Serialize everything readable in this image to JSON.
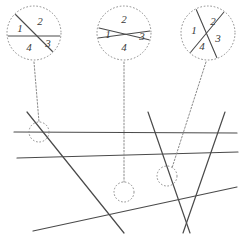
{
  "figure": {
    "width": 248,
    "height": 247,
    "background_color": "#ffffff",
    "line_color": "#4a4a4a",
    "callout_color": "#8a8a8a",
    "label_color": "#3a3a3a"
  },
  "arrangement": {
    "description": "Six straight lines crossing in the lower portion of the figure",
    "lines": [
      {
        "name": "horizontal-line",
        "x1": 14,
        "y1": 132,
        "x2": 237,
        "y2": 133
      },
      {
        "name": "steep-descending-line",
        "x1": 27,
        "y1": 112,
        "x2": 124,
        "y2": 233
      },
      {
        "name": "shallow-ascending-line",
        "x1": 17,
        "y1": 158,
        "x2": 238,
        "y2": 152
      },
      {
        "name": "shallow-descending-line",
        "x1": 33,
        "y1": 231,
        "x2": 237,
        "y2": 187
      },
      {
        "name": "v-left-line",
        "x1": 148,
        "y1": 112,
        "x2": 190,
        "y2": 233
      },
      {
        "name": "v-right-line",
        "x1": 225,
        "y1": 112,
        "x2": 183,
        "y2": 233
      }
    ]
  },
  "intersections": [
    {
      "name": "intersection-left",
      "cx": 39,
      "cy": 132,
      "r": 10
    },
    {
      "name": "intersection-middle",
      "cx": 124,
      "cy": 192,
      "r": 10
    },
    {
      "name": "intersection-right",
      "cx": 167,
      "cy": 176,
      "r": 10
    }
  ],
  "leaders": [
    {
      "name": "leader-left",
      "x1": 34,
      "y1": 62,
      "x2": 39,
      "y2": 122
    },
    {
      "name": "leader-middle",
      "x1": 124,
      "y1": 62,
      "x2": 124,
      "y2": 182
    },
    {
      "name": "leader-right",
      "x1": 206,
      "y1": 62,
      "x2": 172,
      "y2": 168
    }
  ],
  "callouts": [
    {
      "name": "callout-left",
      "cx": 34,
      "cy": 33,
      "r": 27,
      "crossing_type": "diagonal-and-horizontal",
      "chords": [
        {
          "name": "chord-diagonal",
          "x1": -19,
          "y1": -19,
          "x2": 19,
          "y2": 19
        },
        {
          "name": "chord-horizontal",
          "x1": -27,
          "y1": 3,
          "x2": 27,
          "y2": 3
        }
      ],
      "labels": [
        {
          "text": "1",
          "x": -14,
          "y": -4
        },
        {
          "text": "2",
          "x": 6,
          "y": -11
        },
        {
          "text": "3",
          "x": 14,
          "y": 11
        },
        {
          "text": "4",
          "x": -5,
          "y": 15
        }
      ]
    },
    {
      "name": "callout-middle",
      "cx": 124,
      "cy": 33,
      "r": 27,
      "crossing_type": "shallow-x",
      "chords": [
        {
          "name": "chord-rising",
          "x1": -26,
          "y1": 5,
          "x2": 26,
          "y2": -2
        },
        {
          "name": "chord-falling",
          "x1": -25,
          "y1": -5,
          "x2": 26,
          "y2": 7
        }
      ],
      "labels": [
        {
          "text": "2",
          "x": 0,
          "y": -13
        },
        {
          "text": "1",
          "x": -16,
          "y": 2
        },
        {
          "text": "3",
          "x": 18,
          "y": 4
        },
        {
          "text": "4",
          "x": 0,
          "y": 15
        }
      ]
    },
    {
      "name": "callout-right",
      "cx": 208,
      "cy": 33,
      "r": 27,
      "crossing_type": "near-perpendicular-steep",
      "chords": [
        {
          "name": "chord-steep-left",
          "x1": -12,
          "y1": -24,
          "x2": 9,
          "y2": 25
        },
        {
          "name": "chord-steep-right",
          "x1": 16,
          "y1": -21,
          "x2": -18,
          "y2": 20
        }
      ],
      "labels": [
        {
          "text": "1",
          "x": -14,
          "y": -2
        },
        {
          "text": "2",
          "x": 5,
          "y": -11
        },
        {
          "text": "3",
          "x": 10,
          "y": 6
        },
        {
          "text": "4",
          "x": -6,
          "y": 14
        }
      ]
    }
  ]
}
